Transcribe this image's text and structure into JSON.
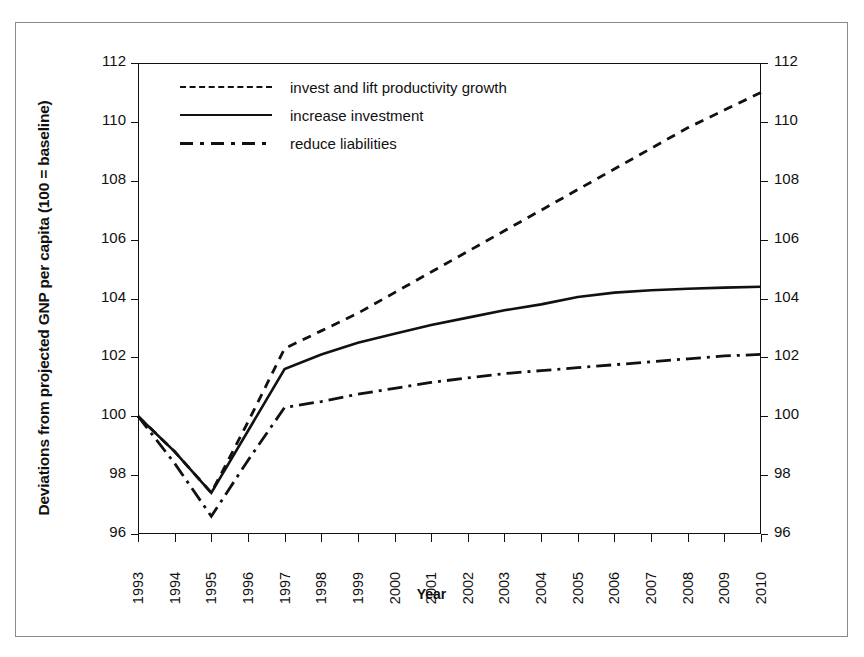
{
  "chart_data": {
    "type": "line",
    "title": "",
    "xlabel": "Year",
    "ylabel": "Deviations from projected GNP per capita (100 = baseline)",
    "categories": [
      "1993",
      "1994",
      "1995",
      "1996",
      "1997",
      "1998",
      "1999",
      "2000",
      "2001",
      "2002",
      "2003",
      "2004",
      "2005",
      "2006",
      "2007",
      "2008",
      "2009",
      "2010"
    ],
    "xlim": [
      1993,
      2010
    ],
    "ylim": [
      96,
      112
    ],
    "yticks": [
      96,
      98,
      100,
      102,
      104,
      106,
      108,
      110,
      112
    ],
    "ytick_labels": [
      "96",
      "98",
      "100",
      "102",
      "104",
      "106",
      "108",
      "110",
      "112"
    ],
    "grid": false,
    "legend_position": "top-left",
    "dual_y_axis": true,
    "series": [
      {
        "name": "invest and lift productivity growth",
        "style": "dashed",
        "color": "#111111",
        "values": [
          100.0,
          98.8,
          97.4,
          99.8,
          102.3,
          102.9,
          103.5,
          104.2,
          104.9,
          105.6,
          106.3,
          107.0,
          107.7,
          108.4,
          109.1,
          109.8,
          110.4,
          111.0
        ]
      },
      {
        "name": "increase investment",
        "style": "solid",
        "color": "#111111",
        "values": [
          100.0,
          98.8,
          97.4,
          99.5,
          101.6,
          102.1,
          102.5,
          102.8,
          103.1,
          103.35,
          103.6,
          103.8,
          104.05,
          104.2,
          104.28,
          104.33,
          104.37,
          104.4
        ]
      },
      {
        "name": "reduce liabilities",
        "style": "dash-dot",
        "color": "#111111",
        "values": [
          100.0,
          98.4,
          96.6,
          98.5,
          100.3,
          100.5,
          100.75,
          100.95,
          101.15,
          101.3,
          101.45,
          101.55,
          101.65,
          101.75,
          101.85,
          101.95,
          102.05,
          102.1
        ]
      }
    ]
  },
  "legend": {
    "items": [
      {
        "label": "invest and lift productivity growth",
        "style": "dashed"
      },
      {
        "label": "increase investment",
        "style": "solid"
      },
      {
        "label": "reduce liabilities",
        "style": "dash-dot"
      }
    ]
  },
  "axes": {
    "x_title": "Year",
    "y_title": "Deviations from projected GNP per capita (100 = baseline)"
  }
}
